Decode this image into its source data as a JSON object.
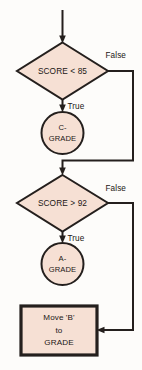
{
  "diagram": {
    "type": "flowchart",
    "colors": {
      "shape_fill": "#f6e0d4",
      "stroke": "#241f1d",
      "background": "#fdfcfa",
      "text": "#1b1714"
    },
    "nodes": [
      {
        "id": "entry",
        "shape": "arrow",
        "label": ""
      },
      {
        "id": "decision-score-lt-85",
        "shape": "diamond",
        "label": "SCORE < 85"
      },
      {
        "id": "terminal-c-grade",
        "shape": "circle",
        "label_line1": "C-",
        "label_line2": "GRADE"
      },
      {
        "id": "decision-score-gt-92",
        "shape": "diamond",
        "label": "SCORE > 92"
      },
      {
        "id": "terminal-a-grade",
        "shape": "circle",
        "label_line1": "A-",
        "label_line2": "GRADE"
      },
      {
        "id": "process-move-b",
        "shape": "rectangle",
        "label_line1": "Move 'B'",
        "label_line2": "to",
        "label_line3": "GRADE"
      }
    ],
    "edge_labels": {
      "false_1": "False",
      "true_1": "True",
      "false_2": "False",
      "true_2": "True"
    }
  }
}
